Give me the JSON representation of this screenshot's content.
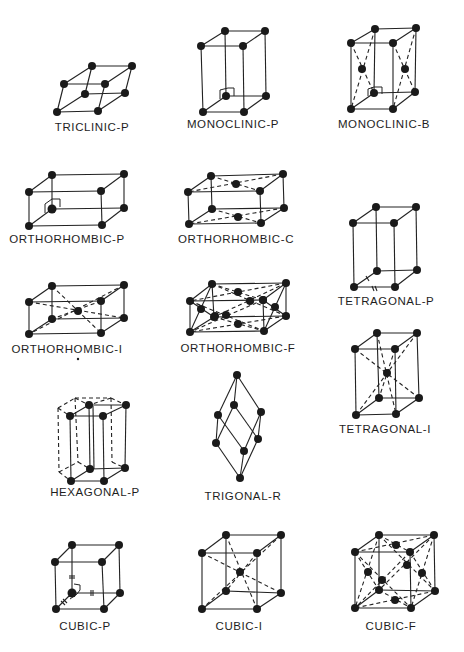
{
  "figure": {
    "lattices": [
      {
        "id": "triclinic-p",
        "label": "TRICLINIC-P",
        "label_x": 92,
        "label_y": 121
      },
      {
        "id": "monoclinic-p",
        "label": "MONOCLINIC-P",
        "label_x": 233,
        "label_y": 118
      },
      {
        "id": "monoclinic-b",
        "label": "MONOCLINIC-B",
        "label_x": 384,
        "label_y": 118
      },
      {
        "id": "orthorhombic-p",
        "label": "ORTHORHOMBIC-P",
        "label_x": 67,
        "label_y": 233
      },
      {
        "id": "orthorhombic-c",
        "label": "ORTHORHOMBIC-C",
        "label_x": 236,
        "label_y": 233
      },
      {
        "id": "tetragonal-p",
        "label": "TETRAGONAL-P",
        "label_x": 386,
        "label_y": 295
      },
      {
        "id": "orthorhombic-i",
        "label": "ORTHORHOMBIC-I",
        "label_x": 67,
        "label_y": 343
      },
      {
        "id": "orthorhombic-f",
        "label": "ORTHORHOMBIC-F",
        "label_x": 238,
        "label_y": 342
      },
      {
        "id": "tetragonal-i",
        "label": "TETRAGONAL-I",
        "label_x": 385,
        "label_y": 423
      },
      {
        "id": "hexagonal-p",
        "label": "HEXAGONAL-P",
        "label_x": 95,
        "label_y": 486
      },
      {
        "id": "trigonal-r",
        "label": "TRIGONAL-R",
        "label_x": 243,
        "label_y": 490
      },
      {
        "id": "cubic-p",
        "label": "CUBIC-P",
        "label_x": 85,
        "label_y": 620
      },
      {
        "id": "cubic-i",
        "label": "CUBIC-I",
        "label_x": 239,
        "label_y": 620
      },
      {
        "id": "cubic-f",
        "label": "CUBIC-F",
        "label_x": 391,
        "label_y": 620
      }
    ]
  }
}
